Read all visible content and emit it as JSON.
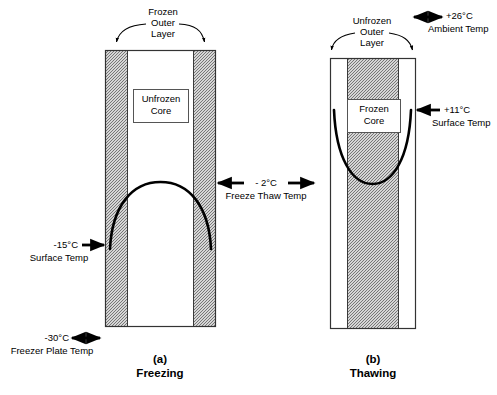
{
  "figure": {
    "title_a": {
      "tag": "(a)",
      "name": "Freezing"
    },
    "title_b": {
      "tag": "(b)",
      "name": "Thawing"
    }
  },
  "panel_a": {
    "callout_outer_layer": "Frozen\nOuter\nLayer",
    "callout_outer_layer_l1": "Frozen",
    "callout_outer_layer_l2": "Outer",
    "callout_outer_layer_l3": "Layer",
    "core_label_l1": "Unfrozen",
    "core_label_l2": "Core",
    "surface_temp_value": "-15°C",
    "surface_temp_name": "Surface Temp",
    "plate_temp_value": "-30°C",
    "plate_temp_name": "Freezer Plate Temp"
  },
  "panel_b": {
    "callout_outer_layer_l1": "Unfrozen",
    "callout_outer_layer_l2": "Outer",
    "callout_outer_layer_l3": "Layer",
    "core_label_l1": "Frozen",
    "core_label_l2": "Core",
    "ambient_temp_value": "+26°C",
    "ambient_temp_name": "Ambient Temp",
    "surface_temp_value": "+11°C",
    "surface_temp_name": "Surface Temp"
  },
  "middle": {
    "freeze_thaw_value": "- 2°C",
    "freeze_thaw_name": "Freeze Thaw Temp"
  },
  "colors": {
    "line": "#000000",
    "hatch_fg": "#6f6f6f",
    "hatch_bg": "#ffffff",
    "box_border": "#555555",
    "curve": "#000000"
  }
}
